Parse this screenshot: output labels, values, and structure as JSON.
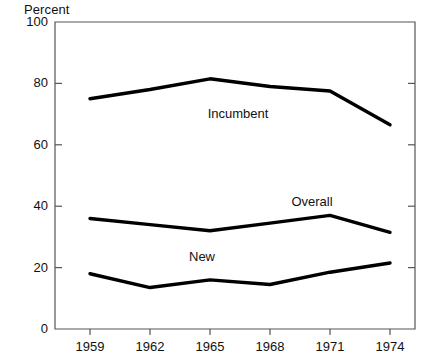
{
  "chart_data": {
    "type": "line",
    "title": "",
    "subtitle": "",
    "xlabel": "",
    "ylabel": "Percent",
    "ylim": [
      0,
      100
    ],
    "yticks": [
      0,
      20,
      40,
      60,
      80,
      100
    ],
    "ytick_labels": [
      "0",
      "20",
      "40",
      "60",
      "80",
      "100"
    ],
    "x": [
      1959,
      1962,
      1965,
      1968,
      1971,
      1974
    ],
    "xtick_labels": [
      "1959",
      "1962",
      "1965",
      "1968",
      "1971",
      "1974"
    ],
    "categories": [
      "1959",
      "1962",
      "1965",
      "1968",
      "1971",
      "1974"
    ],
    "grid": false,
    "legend_position": "inline-annotations",
    "series": [
      {
        "name": "Incumbent",
        "values": [
          75,
          78,
          81.5,
          79,
          77.5,
          66.5
        ],
        "color": "#000000",
        "label_x": 1966.4,
        "label_y": 70
      },
      {
        "name": "Overall",
        "values": [
          36,
          34,
          32,
          34.5,
          37,
          31.5
        ],
        "color": "#000000",
        "label_x": 1970.1,
        "label_y": 41.5
      },
      {
        "name": "New",
        "values": [
          18,
          13.5,
          16,
          14.5,
          18.5,
          21.5
        ],
        "color": "#000000",
        "label_x": 1964.6,
        "label_y": 23.5
      }
    ]
  },
  "axes": {
    "y_axis_title": "Percent",
    "ticks_y": [
      {
        "label": "100",
        "value": 100
      },
      {
        "label": "80",
        "value": 80
      },
      {
        "label": "60",
        "value": 60
      },
      {
        "label": "40",
        "value": 40
      },
      {
        "label": "20",
        "value": 20
      },
      {
        "label": "0",
        "value": 0
      }
    ],
    "ticks_x": [
      {
        "label": "1959",
        "value": 1959
      },
      {
        "label": "1962",
        "value": 1962
      },
      {
        "label": "1965",
        "value": 1965
      },
      {
        "label": "1968",
        "value": 1968
      },
      {
        "label": "1971",
        "value": 1971
      },
      {
        "label": "1974",
        "value": 1974
      }
    ]
  },
  "style": {
    "line_color": "#000000",
    "axis_color": "#555555",
    "text_color": "#111111",
    "background": "#ffffff"
  }
}
